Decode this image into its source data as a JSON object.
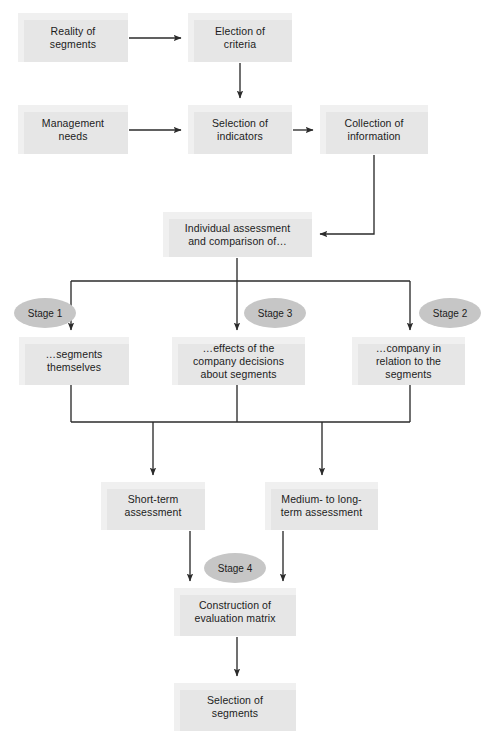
{
  "diagram": {
    "colors": {
      "box_fill": "#e6e6e6",
      "box_highlight": "#f0f0f0",
      "stage_fill": "#c6c6c6",
      "connector": "#2b2b2b",
      "text": "#1c1c1c",
      "background": "#ffffff"
    },
    "nodes": [
      {
        "id": "reality",
        "label": "Reality of\nsegments",
        "line1": "Reality of",
        "line2": "segments",
        "line3": "",
        "x": 18,
        "y": 13,
        "w": 110,
        "h": 49
      },
      {
        "id": "election",
        "label": "Election of\ncriteria",
        "line1": "Election of",
        "line2": "criteria",
        "line3": "",
        "x": 188,
        "y": 13,
        "w": 104,
        "h": 49
      },
      {
        "id": "management",
        "label": "Management\nneeds",
        "line1": "Management",
        "line2": "needs",
        "line3": "",
        "x": 18,
        "y": 105,
        "w": 110,
        "h": 49
      },
      {
        "id": "indicators",
        "label": "Selection of\nindicators",
        "line1": "Selection of",
        "line2": "indicators",
        "line3": "",
        "x": 188,
        "y": 105,
        "w": 104,
        "h": 49
      },
      {
        "id": "collection",
        "label": "Collection of\ninformation",
        "line1": "Collection of",
        "line2": "information",
        "line3": "",
        "x": 320,
        "y": 105,
        "w": 108,
        "h": 49
      },
      {
        "id": "individual",
        "label": "Individual assessment\nand comparison of…",
        "line1": "Individual assessment",
        "line2": "and comparison of…",
        "line3": "",
        "x": 163,
        "y": 212,
        "w": 149,
        "h": 45
      },
      {
        "id": "segments",
        "label": "…segments\nthemselves",
        "line1": "…segments",
        "line2": "themselves",
        "line3": "",
        "x": 19,
        "y": 337,
        "w": 110,
        "h": 48
      },
      {
        "id": "effects",
        "label": "…effects of the\ncompany decisions\nabout segments",
        "line1": "…effects of the",
        "line2": "company decisions",
        "line3": "about segments",
        "x": 172,
        "y": 337,
        "w": 133,
        "h": 48
      },
      {
        "id": "company",
        "label": "…company in\nrelation to the\nsegments",
        "line1": "…company in",
        "line2": "relation to the",
        "line3": "segments",
        "x": 352,
        "y": 337,
        "w": 113,
        "h": 48
      },
      {
        "id": "shortterm",
        "label": "Short-term\nassessment",
        "line1": "Short-term",
        "line2": "assessment",
        "line3": "",
        "x": 101,
        "y": 482,
        "w": 104,
        "h": 48
      },
      {
        "id": "longterm",
        "label": "Medium- to long-\nterm assessment",
        "line1": "Medium- to long-",
        "line2": "term assessment",
        "line3": "",
        "x": 265,
        "y": 482,
        "w": 113,
        "h": 48
      },
      {
        "id": "construction",
        "label": "Construction of\nevaluation matrix",
        "line1": "Construction of",
        "line2": "evaluation matrix",
        "line3": "",
        "x": 174,
        "y": 588,
        "w": 122,
        "h": 48
      },
      {
        "id": "selection",
        "label": "Selection of\nsegments",
        "line1": "Selection of",
        "line2": "segments",
        "line3": "",
        "x": 174,
        "y": 683,
        "w": 122,
        "h": 48
      }
    ],
    "stages": [
      {
        "id": "stage1",
        "label": "Stage 1",
        "cx": 45,
        "cy": 313,
        "rx": 31,
        "ry": 15
      },
      {
        "id": "stage3",
        "label": "Stage 3",
        "cx": 275,
        "cy": 313,
        "rx": 31,
        "ry": 15
      },
      {
        "id": "stage2",
        "label": "Stage 2",
        "cx": 450,
        "cy": 313,
        "rx": 31,
        "ry": 15
      },
      {
        "id": "stage4",
        "label": "Stage 4",
        "cx": 235,
        "cy": 568,
        "rx": 31,
        "ry": 15
      }
    ],
    "edges": [
      {
        "id": "reality-to-election",
        "from": "reality",
        "to": "election",
        "type": "horizontal"
      },
      {
        "id": "election-to-indicators",
        "from": "election",
        "to": "indicators",
        "type": "vertical"
      },
      {
        "id": "management-to-indicators",
        "from": "management",
        "to": "indicators",
        "type": "horizontal"
      },
      {
        "id": "indicators-to-collection",
        "from": "indicators",
        "to": "collection",
        "type": "horizontal"
      },
      {
        "id": "collection-to-individual",
        "from": "collection",
        "to": "individual",
        "type": "elbow"
      },
      {
        "id": "individual-to-segments",
        "from": "individual",
        "to": "segments",
        "type": "branch"
      },
      {
        "id": "individual-to-effects",
        "from": "individual",
        "to": "effects",
        "type": "vertical"
      },
      {
        "id": "individual-to-company",
        "from": "individual",
        "to": "company",
        "type": "branch"
      },
      {
        "id": "segments-to-shortterm",
        "from": "segments",
        "to": "shortterm",
        "type": "merge"
      },
      {
        "id": "effects-to-merge",
        "from": "effects",
        "to": "shortterm",
        "type": "merge"
      },
      {
        "id": "company-to-longterm",
        "from": "company",
        "to": "longterm",
        "type": "merge"
      },
      {
        "id": "shortterm-to-construction",
        "from": "shortterm",
        "to": "construction",
        "type": "vertical"
      },
      {
        "id": "longterm-to-construction",
        "from": "longterm",
        "to": "construction",
        "type": "vertical"
      },
      {
        "id": "construction-to-selection",
        "from": "construction",
        "to": "selection",
        "type": "vertical"
      }
    ]
  }
}
